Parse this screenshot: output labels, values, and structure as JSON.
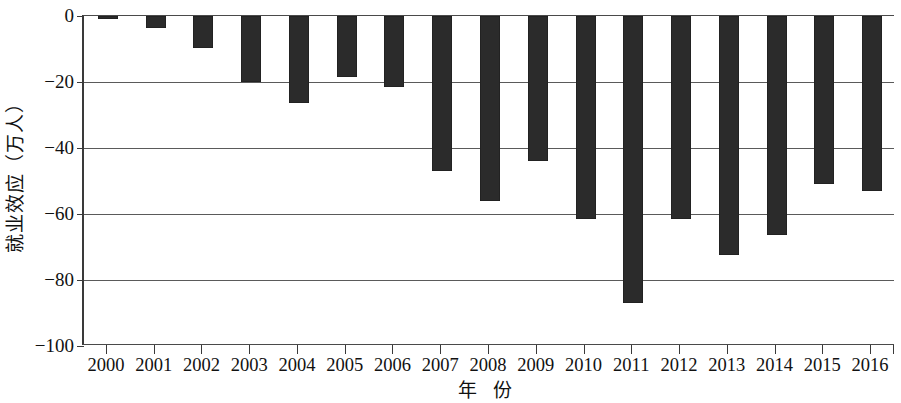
{
  "chart_data": {
    "type": "bar",
    "title": "",
    "subtitle": "",
    "xlabel": "年  份",
    "ylabel": "就业效应（万人）",
    "categories": [
      "2000",
      "2001",
      "2002",
      "2003",
      "2004",
      "2005",
      "2006",
      "2007",
      "2008",
      "2009",
      "2010",
      "2011",
      "2012",
      "2013",
      "2014",
      "2015",
      "2016"
    ],
    "values": [
      -1,
      -3.5,
      -9.8,
      -20,
      -26.5,
      -18.5,
      -21.5,
      -47,
      -56,
      -44,
      -61.5,
      -87,
      -61.5,
      -72.5,
      -66.5,
      -51,
      -53
    ],
    "series": [
      {
        "name": "就业效应",
        "values": [
          -1,
          -3.5,
          -9.8,
          -20,
          -26.5,
          -18.5,
          -21.5,
          -47,
          -56,
          -44,
          -61.5,
          -87,
          -61.5,
          -72.5,
          -66.5,
          -51,
          -53
        ]
      }
    ],
    "ylim": [
      -100,
      0
    ],
    "yticks": [
      0,
      -20,
      -40,
      -60,
      -80,
      -100
    ],
    "ytick_labels": [
      "0",
      "−20",
      "−40",
      "−60",
      "−80",
      "−100"
    ],
    "xtick_labels": [
      "2000",
      "2001",
      "2002",
      "2003",
      "2004",
      "2005",
      "2006",
      "2007",
      "2008",
      "2009",
      "2010",
      "2011",
      "2012",
      "2013",
      "2014",
      "2015",
      "2016"
    ],
    "grid": true,
    "grid_axis": "y",
    "legend": false,
    "legend_position": "none",
    "bar_color": "#2b2b2b",
    "axis_color": "#3a3a3a",
    "grid_color": "#5a5a5a",
    "background_color": "#ffffff",
    "orientation": "vertical",
    "annotations": []
  }
}
